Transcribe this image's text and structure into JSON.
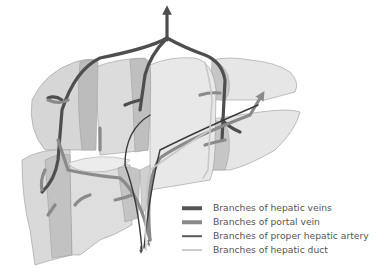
{
  "figure": {
    "colors": {
      "background": "#ffffff",
      "liver_fill_light": "#e4e4e4",
      "liver_fill_mid": "#d2d2d2",
      "liver_fill_dark": "#bdbdbd",
      "liver_outline": "#9a9a9a",
      "hepatic_veins": "#4e4e4e",
      "portal_vein": "#8a8a8a",
      "proper_hepatic_artery": "#3a3a3a",
      "hepatic_duct": "#c8c8c8"
    }
  },
  "legend": {
    "items": [
      {
        "label": "Branches of hepatic veins",
        "color": "#555555",
        "weight": "thick"
      },
      {
        "label": "Branches of portal vein",
        "color": "#8a8a8a",
        "weight": "thick"
      },
      {
        "label": "Branches of proper hepatic artery",
        "color": "#5a5a5a",
        "weight": "medium"
      },
      {
        "label": "Branches of hepatic duct",
        "color": "#9a9a9a",
        "weight": "thin"
      }
    ]
  }
}
